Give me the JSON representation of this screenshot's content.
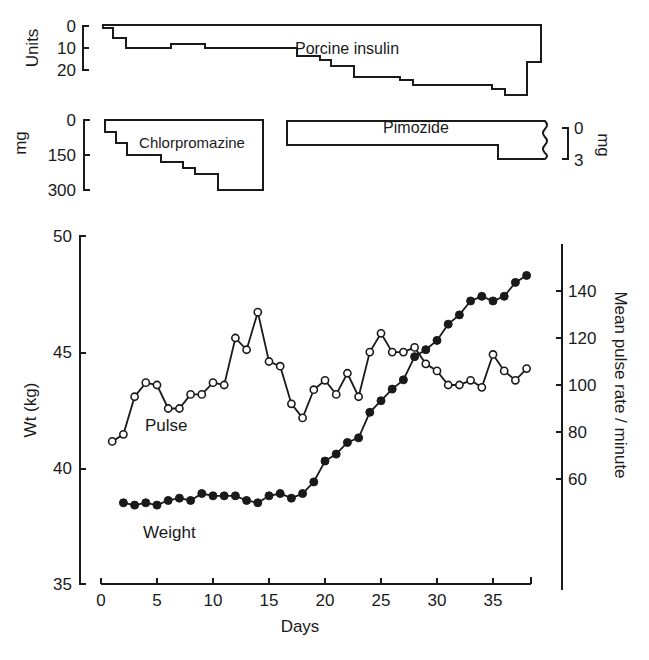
{
  "chart_data": [
    {
      "panel": "insulin",
      "type": "area",
      "title": "Porcine insulin",
      "ylabel": "Units",
      "yticks": [
        "0",
        "10",
        "20"
      ],
      "ylim": [
        0,
        30
      ],
      "inverted_y": true,
      "x_unit": "Days",
      "steps": [
        {
          "from_day": 0.2,
          "to_day": 1,
          "dose": 1
        },
        {
          "from_day": 1,
          "to_day": 2.1,
          "dose": 5
        },
        {
          "from_day": 2.1,
          "to_day": 6.2,
          "dose": 10
        },
        {
          "from_day": 6.2,
          "to_day": 9.3,
          "dose": 8
        },
        {
          "from_day": 9.3,
          "to_day": 17.5,
          "dose": 10
        },
        {
          "from_day": 17.5,
          "to_day": 19.6,
          "dose": 13
        },
        {
          "from_day": 19.6,
          "to_day": 20.5,
          "dose": 15
        },
        {
          "from_day": 20.5,
          "to_day": 22.6,
          "dose": 18
        },
        {
          "from_day": 22.6,
          "to_day": 26.8,
          "dose": 23
        },
        {
          "from_day": 26.8,
          "to_day": 28,
          "dose": 25
        },
        {
          "from_day": 28,
          "to_day": 35,
          "dose": 27
        },
        {
          "from_day": 35,
          "to_day": 36.3,
          "dose": 29
        },
        {
          "from_day": 36.3,
          "to_day": 38.2,
          "dose": 32
        },
        {
          "from_day": 38.2,
          "to_day": 39.5,
          "dose": 16
        }
      ]
    },
    {
      "panel": "chlorpromazine",
      "type": "area",
      "title": "Chlorpromazine",
      "ylabel": "mg",
      "yticks": [
        "0",
        "150",
        "300"
      ],
      "ylim": [
        0,
        300
      ],
      "inverted_y": true,
      "steps": [
        {
          "from_day": 0.3,
          "to_day": 1.4,
          "dose": 50
        },
        {
          "from_day": 1.4,
          "to_day": 2.4,
          "dose": 100
        },
        {
          "from_day": 2.4,
          "to_day": 5.4,
          "dose": 150
        },
        {
          "from_day": 5.4,
          "to_day": 7.4,
          "dose": 180
        },
        {
          "from_day": 7.4,
          "to_day": 8.5,
          "dose": 205
        },
        {
          "from_day": 8.5,
          "to_day": 10.5,
          "dose": 230
        },
        {
          "from_day": 10.5,
          "to_day": 14.5,
          "dose": 300
        }
      ]
    },
    {
      "panel": "pimozide",
      "type": "area",
      "title": "Pimozide",
      "ylabel": "mg",
      "yticks": [
        "0",
        "3"
      ],
      "ylim": [
        0,
        3
      ],
      "inverted_y": true,
      "y_axis_side": "right",
      "steps": [
        {
          "from_day": 16.7,
          "to_day": 35.6,
          "dose": 2
        },
        {
          "from_day": 35.6,
          "to_day": 39.8,
          "dose": 3
        }
      ]
    },
    {
      "panel": "main",
      "type": "line",
      "xlabel": "Days",
      "xticks": [
        "0",
        "5",
        "10",
        "15",
        "20",
        "25",
        "30",
        "35"
      ],
      "xlim": [
        0,
        38
      ],
      "ylabel": "Wt (kg)",
      "yticks": [
        "35",
        "40",
        "45",
        "50"
      ],
      "ylim": [
        35,
        50
      ],
      "y2label": "Mean pulse rate / minute",
      "y2ticks": [
        "60",
        "80",
        "100",
        "120",
        "140"
      ],
      "y2lim": [
        20,
        160
      ],
      "grid": false,
      "series": [
        {
          "name": "Pulse",
          "axis": "right",
          "marker": "open-circle",
          "x": [
            1,
            2,
            3,
            4,
            5,
            6,
            7,
            8,
            9,
            10,
            11,
            12,
            13,
            14,
            15,
            16,
            17,
            18,
            19,
            20,
            21,
            22,
            23,
            24,
            25,
            26,
            27,
            28,
            29,
            30,
            31,
            32,
            33,
            34,
            35,
            36,
            37,
            38
          ],
          "values": [
            76,
            79,
            95,
            101,
            100,
            90,
            90,
            96,
            96,
            101,
            100,
            120,
            115,
            131,
            110,
            108,
            92,
            86,
            98,
            102,
            96,
            105,
            95,
            114,
            122,
            114,
            114,
            116,
            109,
            106,
            100,
            100,
            102,
            99,
            113,
            106,
            102,
            107
          ]
        },
        {
          "name": "Weight",
          "axis": "left",
          "marker": "filled-circle",
          "x": [
            2,
            3,
            4,
            5,
            6,
            7,
            8,
            9,
            10,
            11,
            12,
            13,
            14,
            15,
            16,
            17,
            18,
            19,
            20,
            21,
            22,
            23,
            24,
            25,
            26,
            27,
            28,
            29,
            30,
            31,
            32,
            33,
            34,
            35,
            36,
            37,
            38
          ],
          "values": [
            38.5,
            38.4,
            38.5,
            38.4,
            38.6,
            38.7,
            38.6,
            38.9,
            38.8,
            38.8,
            38.8,
            38.6,
            38.5,
            38.8,
            38.9,
            38.7,
            38.9,
            39.4,
            40.3,
            40.6,
            41.1,
            41.3,
            42.4,
            42.9,
            43.4,
            43.8,
            44.8,
            45.1,
            45.5,
            46.2,
            46.6,
            47.2,
            47.4,
            47.2,
            47.4,
            48.0,
            48.3
          ]
        }
      ]
    }
  ],
  "labels": {
    "insulin_title": "Porcine insulin",
    "insulin_ylabel": "Units",
    "insulin_t0": "0",
    "insulin_t10": "10",
    "insulin_t20": "20",
    "chlor_title": "Chlorpromazine",
    "chlor_ylabel": "mg",
    "chlor_t0": "0",
    "chlor_t150": "150",
    "chlor_t300": "300",
    "pimo_title": "Pimozide",
    "pimo_ylabel": "mg",
    "pimo_t0": "0",
    "pimo_t3": "3",
    "ylabel_left": "Wt (kg)",
    "ylabel_right": "Mean pulse rate / minute",
    "xlabel": "Days",
    "pulse_label": "Pulse",
    "weight_label": "Weight"
  }
}
